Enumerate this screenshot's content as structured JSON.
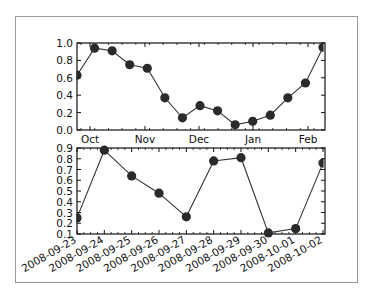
{
  "chart_data": [
    {
      "type": "line",
      "title": "",
      "xlabel": "",
      "ylabel": "",
      "x_tick_labels": [
        "Oct",
        "Nov",
        "Dec",
        "Jan",
        "Feb"
      ],
      "y_tick_labels": [
        "0.0",
        "0.2",
        "0.4",
        "0.6",
        "0.8",
        "1.0"
      ],
      "ylim": [
        0.0,
        1.0
      ],
      "grid": false,
      "marker": "circle",
      "series": [
        {
          "name": "monthly",
          "values": [
            0.63,
            0.94,
            0.91,
            0.75,
            0.71,
            0.37,
            0.14,
            0.28,
            0.22,
            0.06,
            0.1,
            0.17,
            0.37,
            0.54,
            0.95
          ]
        }
      ]
    },
    {
      "type": "line",
      "title": "",
      "xlabel": "",
      "ylabel": "",
      "categories": [
        "2008-09-23",
        "2008-09-24",
        "2008-09-25",
        "2008-09-26",
        "2008-09-27",
        "2008-09-28",
        "2008-09-29",
        "2008-09-30",
        "2008-10-01",
        "2008-10-02"
      ],
      "y_tick_labels": [
        "0.1",
        "0.2",
        "0.3",
        "0.4",
        "0.5",
        "0.6",
        "0.7",
        "0.8",
        "0.9"
      ],
      "ylim": [
        0.1,
        0.9
      ],
      "grid": false,
      "marker": "circle",
      "series": [
        {
          "name": "daily",
          "values": [
            0.25,
            0.88,
            0.64,
            0.48,
            0.26,
            0.78,
            0.81,
            0.11,
            0.15,
            0.76
          ]
        }
      ]
    }
  ],
  "colors": {
    "line": "#333333",
    "marker": "#2a2a2a",
    "axes": "#111111",
    "frame_border": "#9a9a9a"
  }
}
